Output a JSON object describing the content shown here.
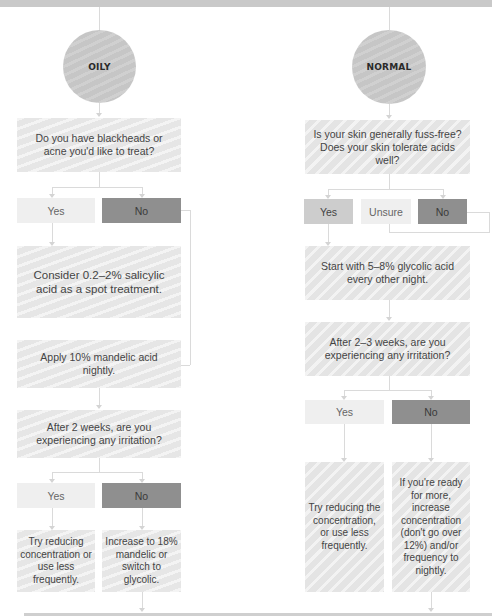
{
  "diagram": {
    "columns": [
      {
        "id": "oily",
        "start": "OILY",
        "question1": "Do you have blackheads or acne you'd like to treat?",
        "answers1": [
          "Yes",
          "No"
        ],
        "yes_result": "Consider 0.2–2% salicylic acid as a spot treatment.",
        "next_step": "Apply 10% mandelic acid nightly.",
        "question2": "After 2 weeks, are you experiencing any irritation?",
        "answers2": [
          "Yes",
          "No"
        ],
        "yes2_result": "Try reducing concentration or use less frequently.",
        "no2_result": "Increase to 18% mandelic or switch to glycolic."
      },
      {
        "id": "normal",
        "start": "NORMAL",
        "question1": "Is your skin generally fuss-free? Does your skin tolerate acids well?",
        "answers1": [
          "Yes",
          "Unsure",
          "No"
        ],
        "yes_result": "Start with 5–8% glycolic acid every other night.",
        "question2": "After 2–3 weeks, are you experiencing any irritation?",
        "answers2": [
          "Yes",
          "No"
        ],
        "yes2_result": "Try reducing the concentration, or use less frequently.",
        "no2_result": "If you're ready for more, increase concentration (don't go over 12%) and/or frequency to nightly."
      }
    ],
    "colors": {
      "band": "#c9c9c9",
      "circle": "#c6c6c6",
      "box": "#e6e6e6",
      "answer_light": "#efefef",
      "answer_mid": "#cdcdcd",
      "answer_dark": "#8f8f8f",
      "connector": "#dadada"
    }
  }
}
